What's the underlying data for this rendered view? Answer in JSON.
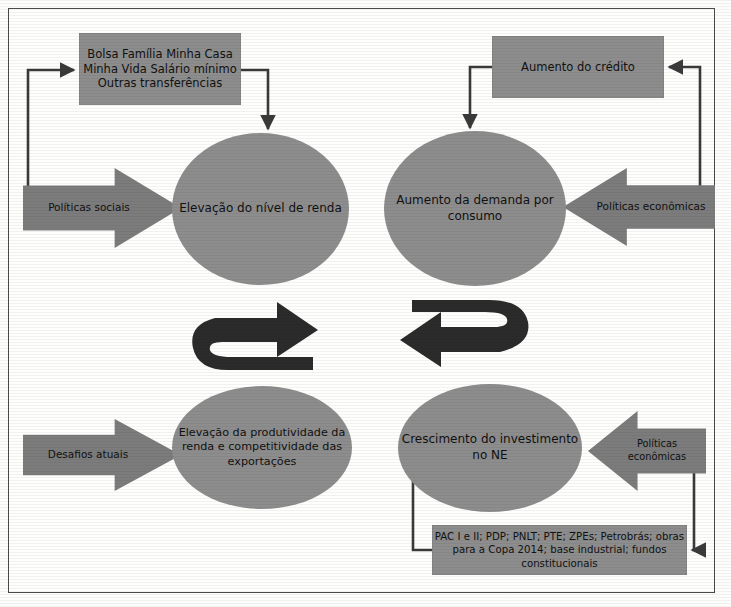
{
  "diagram": {
    "type": "flow-cycle",
    "title": "",
    "language": "pt-BR",
    "colors": {
      "node_fill": "#8d8d8d",
      "arrow_fill": "#7c7c7c",
      "connector": "#3a3a3a",
      "page_background": "#fdfdfc",
      "frame_border": "#4a4a4a",
      "text": "#111111"
    }
  },
  "boxes": {
    "social_programs": {
      "lines": [
        "Bolsa Família",
        "Minha Casa Minha Vida",
        "Salário mínimo",
        "Outras transferências"
      ],
      "text": "Bolsa Família Minha Casa Minha Vida Salário mínimo Outras transferências"
    },
    "credit": {
      "lines": [
        "Aumento do",
        "crédito"
      ],
      "text": "Aumento do crédito"
    },
    "investment_programs": {
      "lines": [
        "PAC I e II; PDP; PNLT; PTE; ZPEs; Petrobrás;",
        "obras para a Copa 2014; base industrial;",
        "fundos constitucionais"
      ],
      "text": "PAC I e II; PDP; PNLT; PTE; ZPEs; Petrobrás; obras para a Copa 2014; base industrial; fundos constitucionais"
    }
  },
  "circles": {
    "income": {
      "lines": [
        "Elevação do",
        "nível de renda"
      ],
      "text": "Elevação do nível de renda"
    },
    "demand": {
      "lines": [
        "Aumento da demanda",
        "por consumo"
      ],
      "text": "Aumento da demanda por consumo"
    },
    "productivity": {
      "lines": [
        "Elevação da produtividade",
        "da renda e competitividade",
        "das exportações"
      ],
      "text": "Elevação da produtividade da renda e competitividade das exportações"
    },
    "investment": {
      "lines": [
        "Crescimento",
        "do investimento no NE"
      ],
      "text": "Crescimento do investimento no NE"
    }
  },
  "block_arrows": {
    "social_policies": {
      "lines": [
        "Políticas",
        "sociais"
      ],
      "text": "Políticas sociais",
      "direction": "right"
    },
    "economic_policies_top": {
      "lines": [
        "Políticas",
        "econômicas"
      ],
      "text": "Políticas econômicas",
      "direction": "left"
    },
    "current_challenges": {
      "lines": [
        "Desafios",
        "atuais"
      ],
      "text": "Desafios atuais",
      "direction": "right"
    },
    "economic_policies_bottom": {
      "lines": [
        "Políticas",
        "econômicas"
      ],
      "text": "Políticas econômicas",
      "direction": "left"
    }
  },
  "cycle_arrows": {
    "left_loop": {
      "label": "",
      "direction": "clockwise-u-turn"
    },
    "right_loop": {
      "label": "",
      "direction": "counterclockwise-u-turn"
    }
  }
}
